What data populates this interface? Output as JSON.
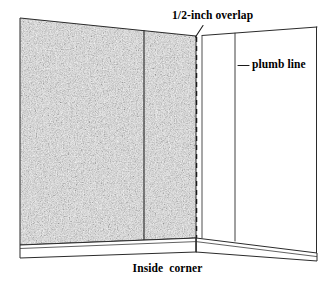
{
  "figure": {
    "title_caption": "Inside  corner",
    "annotations": {
      "overlap_label": "1/2-inch overlap",
      "plumb_label": "plumb line",
      "caption_label": "Inside  corner"
    },
    "colors": {
      "ink": "#1a1a1a",
      "line": "#2b2b2b",
      "paper": "#ffffff",
      "wallpaper_texture_light": "#d8d8d8",
      "wallpaper_texture_mid": "#a8a8a8",
      "wallpaper_texture_dark": "#6f6f6f"
    },
    "elements": {
      "left_wall_name": "papered wall with stipple texture",
      "right_wall_name": "bare wall",
      "seam_name": "wallpaper seam",
      "corner_edge_name": "dashed overlap edge at inside corner",
      "plumb_line_name": "vertical plumb line on bare wall",
      "baseboard_name": "baseboard band along floor"
    },
    "geometry": {
      "left_wall_top_left_y": 18,
      "left_wall_top_right_y": 36,
      "corner_x": 196,
      "right_wall_right_x": 317,
      "right_wall_top_right_y": 27,
      "baseboard_apex_y": 245,
      "seam_x": 144,
      "plumb_x": 235
    }
  }
}
